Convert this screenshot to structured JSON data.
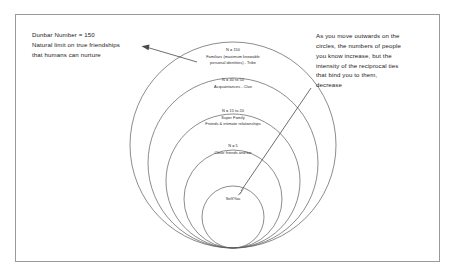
{
  "diagram": {
    "title_note_left": "Dunbar Number = 150\nNatural limit on true friendships\nthat humans can nurture",
    "title_note_right": "As you move outwards on the\ncircles, the numbers of people\nyou know increase, but the\nintensity of the reciprocal ties\nthat bind you to them,\ndecrease",
    "rings": [
      {
        "id": "tribe",
        "count_label": "N = 150",
        "description": "Familiars (maximum knowable",
        "description2": "personal identities) - Tribe"
      },
      {
        "id": "clan",
        "count_label": "N = 40 to 50",
        "description": "Acquaintances - Clan",
        "description2": ""
      },
      {
        "id": "super-family",
        "count_label": "N = 15 to 20",
        "description": "Super Family",
        "description2": "Friends & intimate relationships"
      },
      {
        "id": "close-friends",
        "count_label": "N = 5",
        "description": "Close friends and kin",
        "description2": ""
      },
      {
        "id": "self",
        "count_label": "Self/You",
        "description": "",
        "description2": ""
      }
    ]
  },
  "colors": {
    "ring_stroke": "#5a5a5a",
    "frame_border": "#9a9a9a",
    "text": "#1a1a1a",
    "arrow": "#4a4a4a"
  }
}
